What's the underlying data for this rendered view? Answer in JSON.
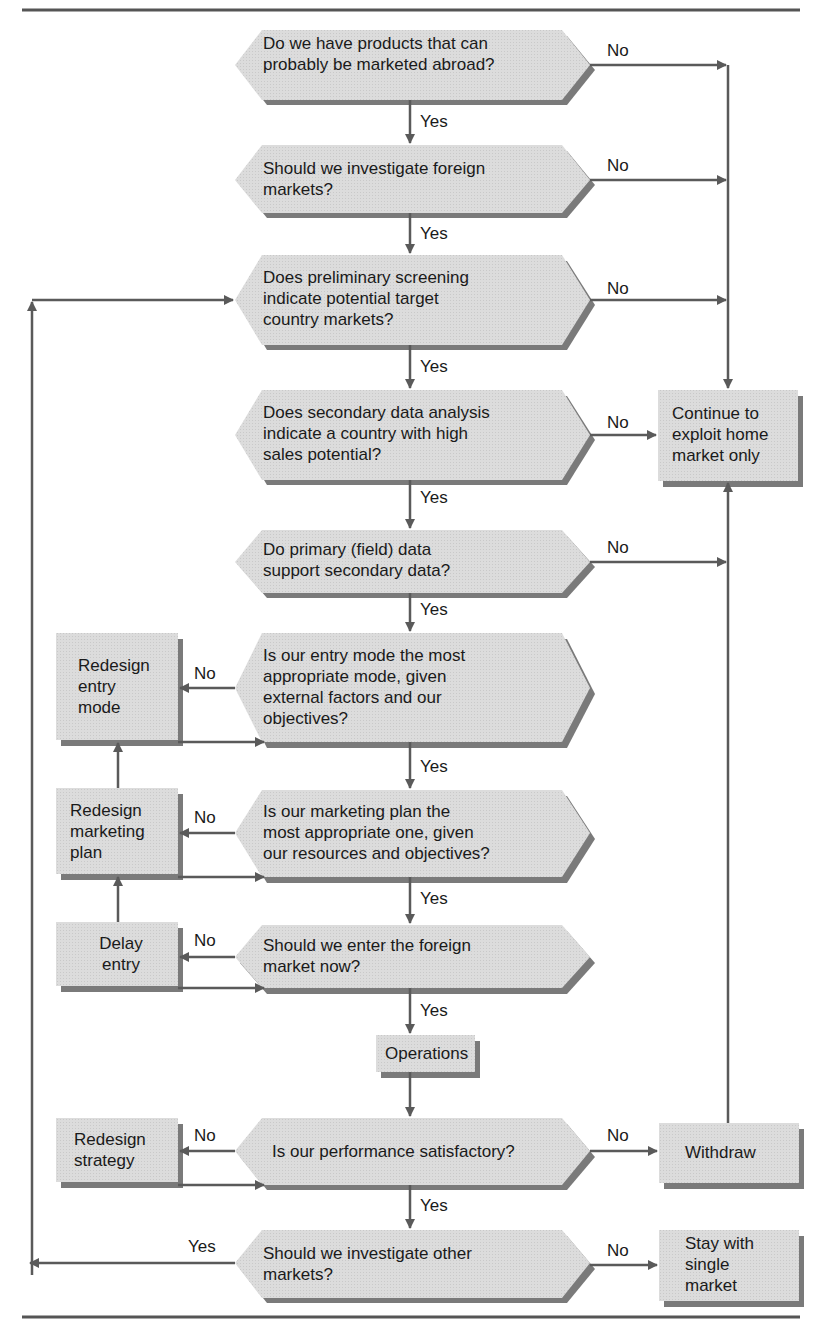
{
  "diagram": {
    "type": "flowchart",
    "title": "",
    "decisions": [
      {
        "id": "d1",
        "lines": [
          "Do we have products that can",
          "probably be marketed abroad?"
        ],
        "yes_label": "Yes",
        "no_label": "No"
      },
      {
        "id": "d2",
        "lines": [
          "Should we investigate foreign",
          "markets?"
        ],
        "yes_label": "Yes",
        "no_label": "No"
      },
      {
        "id": "d3",
        "lines": [
          "Does preliminary screening",
          "indicate potential target",
          "country markets?"
        ],
        "yes_label": "Yes",
        "no_label": "No"
      },
      {
        "id": "d4",
        "lines": [
          "Does secondary data analysis",
          "indicate a country with high",
          "sales potential?"
        ],
        "yes_label": "Yes",
        "no_label": "No"
      },
      {
        "id": "d5",
        "lines": [
          "Do primary (field) data",
          "support secondary data?"
        ],
        "yes_label": "Yes",
        "no_label": "No"
      },
      {
        "id": "d6",
        "lines": [
          "Is our entry mode the most",
          "appropriate mode, given",
          "external factors and our",
          "objectives?"
        ],
        "yes_label": "Yes",
        "no_label": "No"
      },
      {
        "id": "d7",
        "lines": [
          "Is our marketing plan the",
          "most appropriate one, given",
          "our resources and objectives?"
        ],
        "yes_label": "Yes",
        "no_label": "No"
      },
      {
        "id": "d8",
        "lines": [
          "Should we enter the foreign",
          "market now?"
        ],
        "yes_label": "Yes",
        "no_label": "No"
      },
      {
        "id": "d9",
        "lines": [
          "Is our performance satisfactory?"
        ],
        "yes_label": "Yes",
        "no_label": "No"
      },
      {
        "id": "d10",
        "lines": [
          "Should we investigate other",
          "markets?"
        ],
        "yes_label": "Yes",
        "no_label": "No"
      }
    ],
    "processes": [
      {
        "id": "p_home",
        "lines": [
          "Continue to",
          "exploit home",
          "market only"
        ]
      },
      {
        "id": "p_entry",
        "lines": [
          "Redesign",
          "entry",
          "mode"
        ]
      },
      {
        "id": "p_plan",
        "lines": [
          "Redesign",
          "marketing",
          "plan"
        ]
      },
      {
        "id": "p_delay",
        "lines": [
          "Delay",
          "entry"
        ]
      },
      {
        "id": "p_ops",
        "lines": [
          "Operations"
        ]
      },
      {
        "id": "p_strategy",
        "lines": [
          "Redesign",
          "strategy"
        ]
      },
      {
        "id": "p_withdraw",
        "lines": [
          "Withdraw"
        ]
      },
      {
        "id": "p_stay",
        "lines": [
          "Stay with",
          "single",
          "market"
        ]
      }
    ],
    "edges": [
      {
        "from": "d1",
        "to": "d2",
        "label": "Yes"
      },
      {
        "from": "d1",
        "to": "p_home",
        "label": "No"
      },
      {
        "from": "d2",
        "to": "d3",
        "label": "Yes"
      },
      {
        "from": "d2",
        "to": "p_home",
        "label": "No"
      },
      {
        "from": "d3",
        "to": "d4",
        "label": "Yes"
      },
      {
        "from": "d3",
        "to": "p_home",
        "label": "No"
      },
      {
        "from": "d4",
        "to": "d5",
        "label": "Yes"
      },
      {
        "from": "d4",
        "to": "p_home",
        "label": "No"
      },
      {
        "from": "d5",
        "to": "d6",
        "label": "Yes"
      },
      {
        "from": "d5",
        "to": "p_home",
        "label": "No"
      },
      {
        "from": "d6",
        "to": "d7",
        "label": "Yes"
      },
      {
        "from": "d6",
        "to": "p_entry",
        "label": "No"
      },
      {
        "from": "p_entry",
        "to": "d6",
        "label": ""
      },
      {
        "from": "d7",
        "to": "d8",
        "label": "Yes"
      },
      {
        "from": "d7",
        "to": "p_plan",
        "label": "No"
      },
      {
        "from": "p_plan",
        "to": "d7",
        "label": ""
      },
      {
        "from": "p_plan",
        "to": "p_entry",
        "label": ""
      },
      {
        "from": "d8",
        "to": "p_ops",
        "label": "Yes"
      },
      {
        "from": "d8",
        "to": "p_delay",
        "label": "No"
      },
      {
        "from": "p_delay",
        "to": "d8",
        "label": ""
      },
      {
        "from": "p_delay",
        "to": "p_plan",
        "label": ""
      },
      {
        "from": "p_ops",
        "to": "d9",
        "label": ""
      },
      {
        "from": "d9",
        "to": "d10",
        "label": "Yes"
      },
      {
        "from": "d9",
        "to": "p_strategy",
        "label": "No"
      },
      {
        "from": "d9",
        "to": "p_withdraw",
        "label": "No"
      },
      {
        "from": "p_strategy",
        "to": "d9",
        "label": ""
      },
      {
        "from": "p_withdraw",
        "to": "p_home",
        "label": ""
      },
      {
        "from": "d10",
        "to": "d3",
        "label": "Yes"
      },
      {
        "from": "d10",
        "to": "p_stay",
        "label": "No"
      }
    ],
    "colors": {
      "fill": "#d9d9d9",
      "shadow": "#7a7a7a",
      "line": "#5a5a5a",
      "rule": "#555555",
      "text": "#1a1a1a"
    }
  }
}
